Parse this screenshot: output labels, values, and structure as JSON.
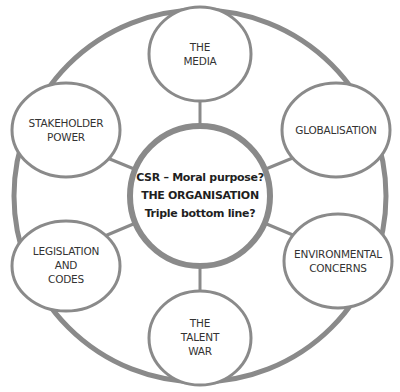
{
  "diagram": {
    "type": "hub-and-spoke",
    "stroke_color": "#8a8a8a",
    "center": {
      "lines": [
        "CSR – Moral purpose?",
        "THE ORGANISATION",
        "Triple bottom line?"
      ]
    },
    "satellites": [
      {
        "id": "media",
        "lines": [
          "THE",
          "MEDIA"
        ]
      },
      {
        "id": "globalisation",
        "lines": [
          "GLOBALISATION"
        ]
      },
      {
        "id": "environmental",
        "lines": [
          "ENVIRONMENTAL",
          "CONCERNS"
        ]
      },
      {
        "id": "talent",
        "lines": [
          "THE",
          "TALENT",
          "WAR"
        ]
      },
      {
        "id": "legislation",
        "lines": [
          "LEGISLATION",
          "AND",
          "CODES"
        ]
      },
      {
        "id": "stakeholder",
        "lines": [
          "STAKEHOLDER",
          "POWER"
        ]
      }
    ]
  }
}
